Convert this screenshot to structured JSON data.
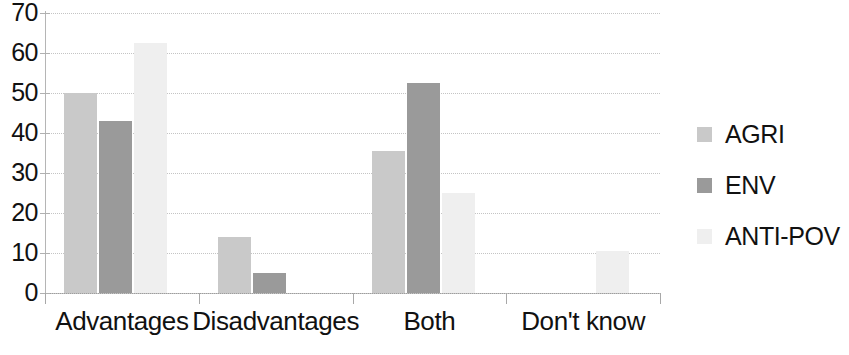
{
  "chart_data": {
    "type": "bar",
    "title": "",
    "subtitle": "",
    "xlabel": "",
    "ylabel": "",
    "categories": [
      "Advantages",
      "Disadvantages",
      "Both",
      "Don't know"
    ],
    "series": [
      {
        "name": "AGRI",
        "color": "#c9c9c9",
        "values": [
          50,
          14,
          35.5,
          0
        ]
      },
      {
        "name": "ENV",
        "color": "#9a9a9a",
        "values": [
          43,
          5,
          52.5,
          0
        ]
      },
      {
        "name": "ANTI-POV",
        "color": "#efefef",
        "values": [
          62.5,
          0,
          25,
          10.5
        ]
      }
    ],
    "ylim": [
      0,
      70
    ],
    "ytick_labels": [
      "70",
      "60",
      "50",
      "40",
      "30",
      "20",
      "10",
      "0"
    ],
    "ytick_values": [
      70,
      60,
      50,
      40,
      30,
      20,
      10,
      0
    ],
    "ytick_step": 10,
    "grid": true,
    "grid_axis": "y",
    "grid_style": "dotted",
    "legend_position": "right",
    "legend_entries": [
      "AGRI",
      "ENV",
      "ANTI-POV"
    ],
    "background_color": "#ffffff",
    "axis_color": "#9d9d9d",
    "gridline_color": "#c4c4c4",
    "text_color": "#111111"
  }
}
